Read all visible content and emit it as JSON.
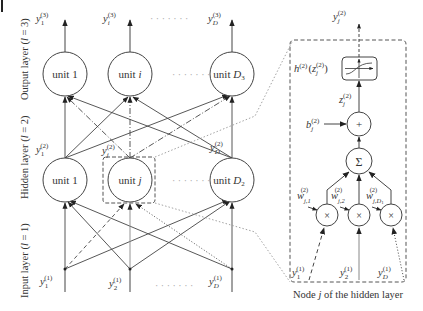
{
  "figure": {
    "layers": {
      "output": {
        "label": "Output layer (l = 3)",
        "units": [
          "unit 1",
          "unit i",
          "unit D3"
        ],
        "outputs": [
          "y1(3)",
          "yi(3)",
          "yD3(3)"
        ]
      },
      "hidden": {
        "label": "Hidden layer (l = 2)",
        "units": [
          "unit 1",
          "unit j",
          "unit D2"
        ],
        "outputs": [
          "y1(2)",
          "yj(2)",
          "yD2(2)"
        ]
      },
      "input": {
        "label": "Input layer (l = 1)",
        "inputs": [
          "y1(1)",
          "y2(1)",
          "yD1(1)"
        ]
      }
    },
    "node_detail": {
      "caption": "Node j of the hidden layer",
      "output": "yj(2)",
      "activation": "h(2)(zj(2))",
      "preactivation": "zj(2)",
      "bias": "bj(2)",
      "sum_symbol": "Σ",
      "add_symbol": "+",
      "mult_symbol": "×",
      "weights": [
        "wj,1(2)",
        "wj,2(2)",
        "wj,D1(2)"
      ],
      "inputs": [
        "y1(1)",
        "y2(1)",
        "yD1(1)"
      ]
    },
    "text": {
      "unit": "unit",
      "one": "1",
      "i": "i",
      "j": "j",
      "D": "D",
      "sub3": "3",
      "sub2": "2",
      "y": "y",
      "s1": "(1)",
      "s2": "(2)",
      "s3": "(3)",
      "sub_1": "1",
      "sub_2": "2",
      "sub_i": "i",
      "sub_j": "j",
      "h": "h",
      "z": "z",
      "b": "b",
      "w": "w",
      "w1": "j,1",
      "w2": "j,2",
      "wD": "j,D",
      "wDsub": "1",
      "open": "(",
      "close": ")",
      "caption_pre": "Node ",
      "caption_post": " of the hidden layer",
      "output_label": "Output layer (",
      "hidden_label": "Hidden layer (",
      "input_label": "Input layer (",
      "l": "l",
      "eq3": " = 3)",
      "eq2": " = 2)",
      "eq1": " = 1)",
      "dots": "· · · · · · ·"
    }
  }
}
